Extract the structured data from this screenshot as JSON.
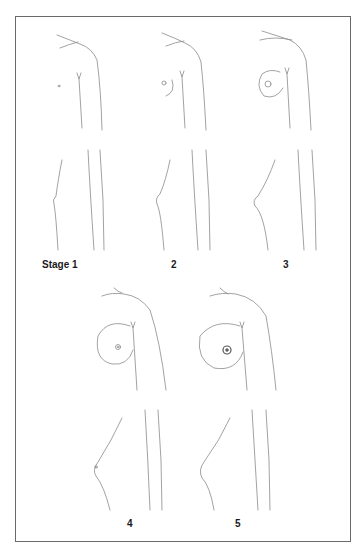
{
  "figure": {
    "title": "",
    "labels": {
      "stage1": "Stage 1",
      "stage2": "2",
      "stage3": "3",
      "stage4": "4",
      "stage5": "5"
    },
    "stroke_color": "#8a8a8a",
    "frame_color": "#6a6a6a"
  }
}
